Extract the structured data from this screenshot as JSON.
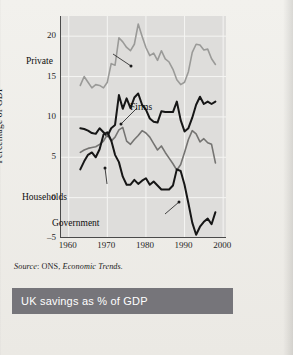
{
  "figure": {
    "source_prefix": "Source",
    "source_body": ": ONS, ",
    "source_italic": "Economic Trends.",
    "caption": "UK savings as % of GDP",
    "caption_bar_color": "#76757a",
    "panel_color": "#dedddb",
    "page_color": "#efeeea"
  },
  "chart_data": {
    "type": "line",
    "title": "UK savings as % of GDP",
    "xlabel": "",
    "ylabel": "Percentage of GDP",
    "xlim": [
      1958,
      2001
    ],
    "ylim": [
      -5,
      22.5
    ],
    "yticks": [
      20,
      15,
      10,
      5,
      0,
      -5
    ],
    "ytick_labels": [
      "20",
      "15",
      "10",
      "5",
      "0",
      "–5"
    ],
    "xticks": [
      1960,
      1970,
      1980,
      1990,
      2000
    ],
    "xtick_labels": [
      "1960",
      "1970",
      "1980",
      "1990",
      "2000"
    ],
    "grid": true,
    "grid_color": "#f5f5f3",
    "legend": "inline-annotations",
    "annotations": [
      {
        "label": "Private",
        "x_px": 14,
        "y_px": 42,
        "leader": "to-series-private"
      },
      {
        "label": "Firms",
        "x_px": 118,
        "y_px": 88,
        "leader": "to-series-firms"
      },
      {
        "label": "Households",
        "x_px": 10,
        "y_px": 178,
        "leader": "to-series-households"
      },
      {
        "label": "Government",
        "x_px": 40,
        "y_px": 204,
        "leader": "to-series-government"
      }
    ],
    "series": [
      {
        "name": "Private",
        "color": "#9a9a98",
        "width": 1.6,
        "x": [
          1963,
          1964,
          1965,
          1966,
          1967,
          1968,
          1969,
          1970,
          1971,
          1972,
          1973,
          1974,
          1975,
          1976,
          1977,
          1978,
          1979,
          1980,
          1981,
          1982,
          1983,
          1984,
          1985,
          1986,
          1987,
          1988,
          1989,
          1990,
          1991,
          1992,
          1993,
          1994,
          1995,
          1996,
          1997,
          1998
        ],
        "values": [
          13.9,
          15.0,
          14.3,
          13.6,
          14.0,
          13.9,
          13.6,
          14.3,
          16.6,
          16.4,
          19.8,
          19.3,
          18.6,
          18.2,
          19.0,
          21.5,
          20.0,
          18.6,
          17.6,
          17.9,
          17.0,
          18.2,
          17.2,
          16.8,
          15.9,
          14.6,
          14.0,
          14.3,
          15.6,
          18.0,
          19.0,
          18.9,
          18.3,
          18.4,
          17.2,
          16.5
        ]
      },
      {
        "name": "Firms",
        "color": "#161616",
        "width": 2.0,
        "x": [
          1963,
          1964,
          1965,
          1966,
          1967,
          1968,
          1969,
          1970,
          1971,
          1972,
          1973,
          1974,
          1975,
          1976,
          1977,
          1978,
          1979,
          1980,
          1981,
          1982,
          1983,
          1984,
          1985,
          1986,
          1987,
          1988,
          1989,
          1990,
          1991,
          1992,
          1993,
          1994,
          1995,
          1996,
          1997,
          1998
        ],
        "values": [
          8.6,
          8.5,
          8.3,
          8.0,
          7.9,
          8.6,
          8.1,
          7.6,
          8.6,
          9.0,
          12.7,
          11.0,
          12.3,
          11.1,
          12.4,
          12.9,
          11.5,
          10.9,
          9.8,
          9.4,
          9.3,
          10.7,
          10.6,
          10.6,
          10.6,
          11.9,
          9.6,
          8.2,
          8.6,
          9.9,
          11.5,
          12.5,
          11.6,
          11.9,
          11.6,
          11.9
        ]
      },
      {
        "name": "Households",
        "color": "#757472",
        "width": 1.6,
        "x": [
          1963,
          1964,
          1965,
          1966,
          1967,
          1968,
          1969,
          1970,
          1971,
          1972,
          1973,
          1974,
          1975,
          1976,
          1977,
          1978,
          1979,
          1980,
          1981,
          1982,
          1983,
          1984,
          1985,
          1986,
          1987,
          1988,
          1989,
          1990,
          1991,
          1992,
          1993,
          1994,
          1995,
          1996,
          1997,
          1998
        ],
        "values": [
          5.6,
          5.9,
          6.1,
          6.2,
          6.3,
          6.6,
          7.0,
          7.8,
          7.0,
          7.5,
          8.4,
          8.7,
          7.0,
          6.6,
          7.2,
          7.7,
          8.3,
          8.0,
          7.5,
          6.7,
          5.9,
          6.4,
          5.6,
          4.9,
          4.2,
          3.4,
          4.1,
          5.6,
          7.2,
          8.3,
          7.9,
          6.9,
          7.3,
          6.8,
          6.6,
          4.3
        ]
      },
      {
        "name": "Government",
        "color": "#161616",
        "width": 2.0,
        "x": [
          1963,
          1964,
          1965,
          1966,
          1967,
          1968,
          1969,
          1970,
          1971,
          1972,
          1973,
          1974,
          1975,
          1976,
          1977,
          1978,
          1979,
          1980,
          1981,
          1982,
          1983,
          1984,
          1985,
          1986,
          1987,
          1988,
          1989,
          1990,
          1991,
          1992,
          1993,
          1994,
          1995,
          1996,
          1997,
          1998
        ],
        "values": [
          3.5,
          4.5,
          5.3,
          5.6,
          5.0,
          6.0,
          7.8,
          8.1,
          7.1,
          5.3,
          4.4,
          2.6,
          1.6,
          1.6,
          2.2,
          1.7,
          2.1,
          2.4,
          1.6,
          2.0,
          1.5,
          1.0,
          1.0,
          1.0,
          1.5,
          3.5,
          3.3,
          1.6,
          -0.7,
          -3.1,
          -4.6,
          -3.6,
          -3.0,
          -2.6,
          -3.3,
          -1.8
        ]
      }
    ]
  }
}
